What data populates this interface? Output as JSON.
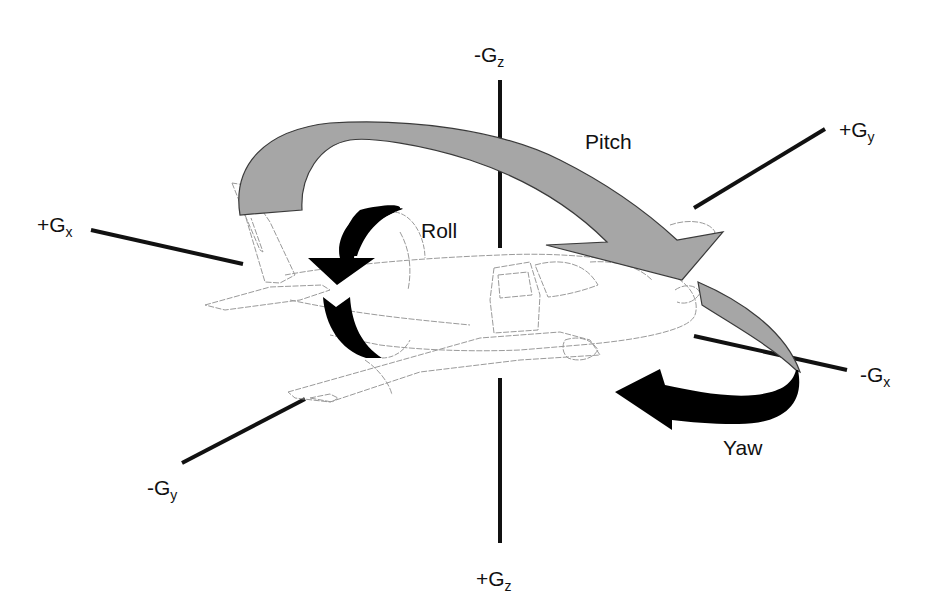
{
  "diagram": {
    "colors": {
      "axis": "#111111",
      "pitch_arrow_fill": "#a6a6a6",
      "pitch_arrow_stroke": "#3a3a3a",
      "roll_arrow_fill": "#000000",
      "yaw_arrow_fill": "#000000",
      "aircraft_outline": "#9a9a9a",
      "background": "#ffffff"
    },
    "axes": {
      "neg_gz": {
        "sign": "-",
        "base": "G",
        "sub": "z"
      },
      "pos_gz": {
        "sign": "+",
        "base": "G",
        "sub": "z"
      },
      "pos_gx": {
        "sign": "+",
        "base": "G",
        "sub": "x"
      },
      "neg_gx": {
        "sign": "-",
        "base": "G",
        "sub": "x"
      },
      "pos_gy": {
        "sign": "+",
        "base": "G",
        "sub": "y"
      },
      "neg_gy": {
        "sign": "-",
        "base": "G",
        "sub": "y"
      }
    },
    "motions": {
      "pitch": "Pitch",
      "roll": "Roll",
      "yaw": "Yaw"
    }
  }
}
